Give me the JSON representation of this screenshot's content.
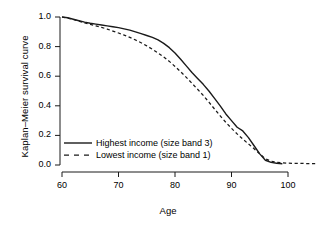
{
  "chart_data": {
    "type": "line",
    "title": "",
    "xlabel": "Age",
    "ylabel": "Kaplan–Meier survival curve",
    "xlim": [
      58,
      107
    ],
    "ylim": [
      0.0,
      1.0
    ],
    "grid": false,
    "legend_position": "bottom-left",
    "xticks": [
      60,
      70,
      80,
      90,
      100
    ],
    "xtick_labels": [
      "60",
      "70",
      "80",
      "90",
      "100"
    ],
    "yticks": [
      0.0,
      0.2,
      0.4,
      0.6,
      0.8,
      1.0
    ],
    "ytick_labels": [
      "0.0",
      "0.2",
      "0.4",
      "0.6",
      "0.8",
      "1.0"
    ],
    "series": [
      {
        "name": "Highest income (size band 3)",
        "style": "solid",
        "color": "#1a1a1a",
        "x": [
          60,
          61,
          62,
          63,
          64,
          65,
          66,
          67,
          68,
          69,
          70,
          71,
          72,
          73,
          74,
          75,
          76,
          77,
          78,
          79,
          80,
          81,
          82,
          83,
          84,
          85,
          86,
          87,
          88,
          89,
          90,
          91,
          92,
          93,
          94,
          95,
          96,
          97,
          98,
          99
        ],
        "y": [
          1.0,
          0.995,
          0.985,
          0.975,
          0.965,
          0.958,
          0.952,
          0.946,
          0.94,
          0.934,
          0.928,
          0.92,
          0.911,
          0.9,
          0.888,
          0.875,
          0.862,
          0.845,
          0.822,
          0.793,
          0.757,
          0.715,
          0.67,
          0.625,
          0.585,
          0.545,
          0.5,
          0.45,
          0.4,
          0.345,
          0.3,
          0.255,
          0.23,
          0.185,
          0.13,
          0.075,
          0.032,
          0.018,
          0.012,
          0.008
        ]
      },
      {
        "name": "Lowest income (size band 1)",
        "style": "dashed",
        "color": "#1a1a1a",
        "x": [
          60,
          61,
          62,
          63,
          64,
          65,
          66,
          67,
          68,
          69,
          70,
          71,
          72,
          73,
          74,
          75,
          76,
          77,
          78,
          79,
          80,
          81,
          82,
          83,
          84,
          85,
          86,
          87,
          88,
          89,
          90,
          91,
          92,
          93,
          94,
          95,
          96,
          97,
          98,
          99,
          100,
          101,
          102,
          103,
          104,
          105
        ],
        "y": [
          1.0,
          0.993,
          0.983,
          0.972,
          0.96,
          0.95,
          0.94,
          0.93,
          0.918,
          0.905,
          0.892,
          0.878,
          0.862,
          0.845,
          0.826,
          0.805,
          0.782,
          0.757,
          0.73,
          0.7,
          0.666,
          0.63,
          0.592,
          0.552,
          0.512,
          0.47,
          0.425,
          0.378,
          0.332,
          0.288,
          0.248,
          0.21,
          0.175,
          0.142,
          0.11,
          0.075,
          0.042,
          0.025,
          0.018,
          0.014,
          0.012,
          0.011,
          0.011,
          0.01,
          0.01,
          0.01
        ]
      }
    ]
  },
  "axes": {
    "y_axis_title": "Kaplan–Meier survival curve",
    "x_axis_title": "Age"
  },
  "legend": {
    "items": [
      {
        "label": "Highest income (size band 3)",
        "style": "solid"
      },
      {
        "label": "Lowest income (size band 1)",
        "style": "dashed"
      }
    ]
  },
  "colors": {
    "axis": "#1a1a1a",
    "line": "#1a1a1a",
    "background": "#ffffff"
  }
}
